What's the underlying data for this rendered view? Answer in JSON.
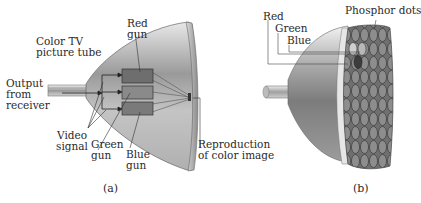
{
  "figure_a": {
    "caption": "(a)",
    "labels": {
      "tube_line1": "Color TV",
      "tube_line2": "picture tube",
      "output_line1": "Output",
      "output_line2": "from",
      "output_line3": "receiver",
      "red_line1": "Red",
      "red_line2": "gun",
      "video_line1": "Video",
      "video_line2": "signal",
      "green_line1": "Green",
      "green_line2": "gun",
      "blue_line1": "Blue",
      "blue_line2": "gun",
      "repro_line1": "Reproduction",
      "repro_line2": "of color image"
    },
    "colors": {
      "red_gun": "#6e6e6e",
      "green_gun": "#8a8a8a",
      "blue_gun": "#7a7a7a"
    }
  },
  "figure_b": {
    "caption": "(b)",
    "labels": {
      "phosphor": "Phosphor dots",
      "red": "Red",
      "green": "Green",
      "blue": "Blue"
    }
  }
}
